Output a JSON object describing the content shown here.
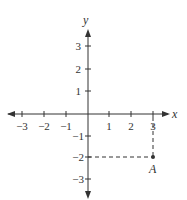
{
  "diagram": {
    "type": "coordinate-plane",
    "x_axis_label": "x",
    "y_axis_label": "y",
    "x_ticks": [
      "−3",
      "−2",
      "−1",
      "1",
      "2",
      "3"
    ],
    "y_ticks": [
      "3",
      "2",
      "1",
      "−1",
      "−2",
      "−3"
    ],
    "point": {
      "label": "A",
      "x": 3,
      "y": -2
    },
    "colors": {
      "ink": "#333333",
      "background": "#ffffff"
    }
  }
}
